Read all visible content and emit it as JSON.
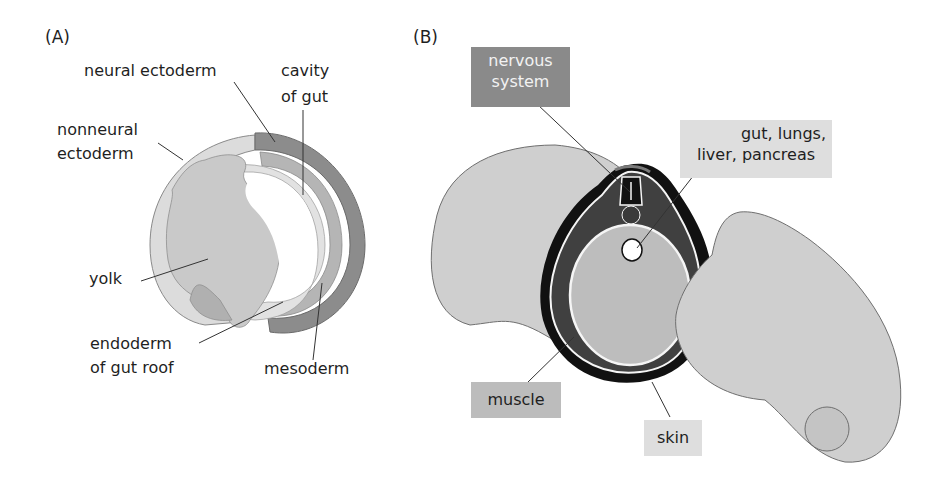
{
  "panel_a": {
    "letter": "(A)",
    "labels": {
      "neural_ectoderm": "neural ectoderm",
      "cavity_of_gut_1": "cavity",
      "cavity_of_gut_2": "of gut",
      "nonneural_ectoderm_1": "nonneural",
      "nonneural_ectoderm_2": "ectoderm",
      "yolk": "yolk",
      "endoderm_1": "endoderm",
      "endoderm_2": "of gut roof",
      "mesoderm": "mesoderm"
    }
  },
  "panel_b": {
    "letter": "(B)",
    "labels": {
      "nervous_system_1": "nervous",
      "nervous_system_2": "system",
      "gut_1": "gut, lungs,",
      "gut_2": "liver, pancreas",
      "muscle": "muscle",
      "skin": "skin"
    }
  },
  "colors": {
    "ectoderm_light": "#d9d9d9",
    "neural_dark": "#8c8c8c",
    "mesoderm_mid": "#b0b0b0",
    "yolk": "#c8c8c8",
    "skin_black": "#111111",
    "muscle_dark": "#404040",
    "gut_fill": "#bdbdbd",
    "body_fill": "#cfcfcf"
  }
}
